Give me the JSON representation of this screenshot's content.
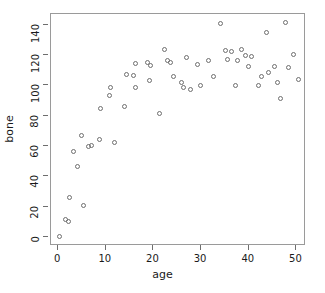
{
  "chart_data": {
    "type": "scatter",
    "title": "",
    "xlabel": "age",
    "ylabel": "bone",
    "xlim": [
      -1.5,
      52
    ],
    "ylim": [
      -6,
      147
    ],
    "xticks": [
      0,
      10,
      20,
      30,
      40,
      50
    ],
    "yticks": [
      0,
      20,
      40,
      60,
      80,
      100,
      120,
      140
    ],
    "grid": false,
    "legend": null,
    "marker": "open-circle",
    "marker_color": "#6e6e6e",
    "frame_color": "#9a9a9a",
    "x": [
      0.2,
      1.6,
      2.1,
      2.4,
      3.2,
      4.0,
      4.9,
      5.3,
      6.4,
      7.0,
      8.6,
      8.9,
      10.8,
      11.0,
      11.9,
      13.9,
      14.3,
      15.8,
      16.2,
      16.3,
      18.7,
      19.1,
      19.3,
      21.2,
      22.3,
      22.9,
      23.6,
      24.3,
      25.9,
      26.4,
      26.9,
      27.8,
      29.3,
      29.9,
      31.5,
      32.6,
      34.0,
      35.1,
      35.6,
      36.3,
      37.2,
      37.6,
      38.4,
      39.4,
      39.9,
      40.6,
      42.0,
      42.6,
      43.7,
      44.2,
      45.4,
      46.0,
      46.6,
      47.6,
      48.3,
      49.4,
      50.4
    ],
    "y": [
      0.0,
      11.5,
      10.3,
      26.2,
      56.0,
      46.5,
      67.0,
      20.8,
      59.5,
      60.5,
      64.5,
      85.0,
      93.0,
      98.5,
      62.5,
      86.0,
      107.0,
      106.5,
      98.5,
      114.5,
      115.0,
      103.0,
      113.0,
      81.5,
      123.5,
      116.5,
      114.8,
      105.8,
      101.5,
      98.5,
      118.5,
      97.5,
      114.0,
      100.0,
      116.5,
      106.0,
      140.5,
      123.0,
      117.0,
      122.5,
      99.8,
      116.5,
      123.5,
      119.5,
      112.5,
      119.0,
      99.8,
      106.0,
      135.0,
      108.5,
      112.5,
      101.5,
      91.5,
      141.5,
      112.0,
      120.0,
      104.0
    ]
  }
}
